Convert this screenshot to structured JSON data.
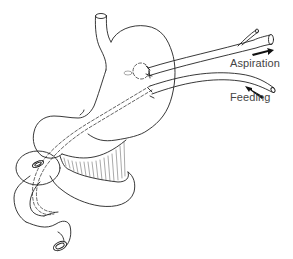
{
  "figure": {
    "labels": {
      "aspiration": "Aspiration",
      "feeding": "Feeding"
    },
    "colors": {
      "line": "#222222",
      "background": "#ffffff",
      "label": "#444444"
    }
  }
}
